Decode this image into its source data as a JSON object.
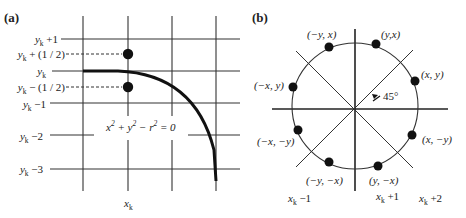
{
  "figure": {
    "panel_a": {
      "label": "(a)",
      "row_labels": [
        {
          "base": "y",
          "sub": "k",
          "suffix": " +1"
        },
        {
          "base": "y",
          "sub": "k",
          "suffix": " + (1 / 2)"
        },
        {
          "base": "y",
          "sub": "k",
          "suffix": ""
        },
        {
          "base": "y",
          "sub": "k",
          "suffix": " − (1 / 2)"
        },
        {
          "base": "y",
          "sub": "k",
          "suffix": " −1"
        },
        {
          "base": "y",
          "sub": "k",
          "suffix": " −2"
        },
        {
          "base": "y",
          "sub": "k",
          "suffix": " −3"
        }
      ],
      "column_label": {
        "base": "x",
        "sub": "k"
      },
      "equation": {
        "p1": "x",
        "e1": "2",
        "p2": " + y",
        "e2": "2",
        "p3": " − r",
        "e3": "2",
        "p4": " = 0"
      },
      "midpoints": [
        {
          "name": "upper-midpoint",
          "label_ref": "y_k + 1/2"
        },
        {
          "name": "lower-midpoint",
          "label_ref": "y_k - 1/2"
        }
      ]
    },
    "panel_b": {
      "label": "(b)",
      "points": [
        {
          "label": "(−y, x)"
        },
        {
          "label": "(y,x)"
        },
        {
          "label": "(−x, y)"
        },
        {
          "label": "(x, y)"
        },
        {
          "label": "(−x, −y)"
        },
        {
          "label": "(x, −y)"
        },
        {
          "label": "(−y, −x)"
        },
        {
          "label": "(y, −x)"
        }
      ],
      "angle_label": "45°",
      "column_labels": [
        {
          "base": "x",
          "sub": "k",
          "suffix": " −1"
        },
        {
          "base": "x",
          "sub": "k",
          "suffix": " +1"
        },
        {
          "base": "x",
          "sub": "k",
          "suffix": " +2"
        }
      ]
    },
    "colors": {
      "ink": "#222222",
      "background": "#ffffff"
    }
  }
}
